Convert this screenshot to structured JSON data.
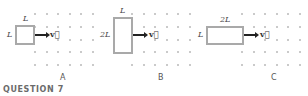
{
  "panels": [
    {
      "id": "A",
      "caption": "A",
      "width_label": "L",
      "height_label": "L",
      "velocity_label": "v⃗"
    },
    {
      "id": "B",
      "caption": "B",
      "width_label": "L",
      "height_label": "2L",
      "velocity_label": "v⃗"
    },
    {
      "id": "C",
      "caption": "C",
      "width_label": "2L",
      "height_label": "L",
      "velocity_label": "v⃗"
    }
  ],
  "field": {
    "symbol": "dot",
    "description": "magnetic field out of page",
    "rows": 5,
    "cols": 6
  },
  "footer": {
    "question_label": "QUESTION 7"
  },
  "colors": {
    "loop": "#a9a9a9",
    "dot": "#b8b8b8",
    "arrow": "#222222",
    "question": "#6b6b6b"
  }
}
